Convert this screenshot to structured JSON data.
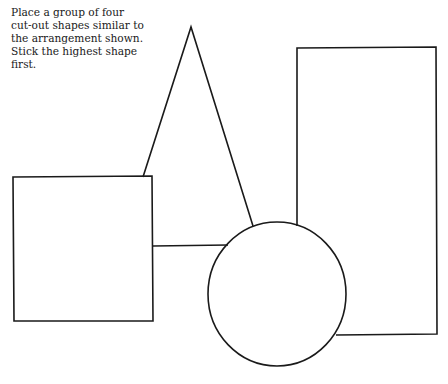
{
  "instructions": {
    "lines": [
      "Place a group of four",
      "cut-out shapes similar to",
      "the arrangement shown.",
      "Stick the highest shape",
      "first."
    ]
  },
  "shapes": [
    {
      "name": "triangle",
      "kind": "visible-outline"
    },
    {
      "name": "square",
      "kind": "front"
    },
    {
      "name": "rectangle",
      "kind": "visible-outline"
    },
    {
      "name": "circle",
      "kind": "front"
    }
  ],
  "colors": {
    "ink": "#1a1a1a",
    "paper": "#ffffff"
  }
}
